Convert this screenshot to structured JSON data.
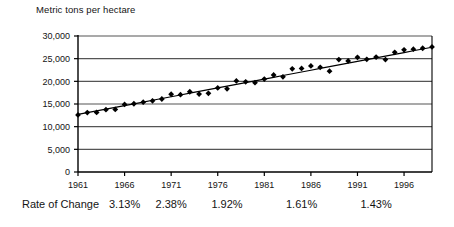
{
  "chart_data": {
    "type": "line",
    "title": "",
    "ylabel": "Metric tons per hectare",
    "xlabel": "",
    "ylim": [
      0,
      30000
    ],
    "xlim": [
      1961,
      1999
    ],
    "grid": true,
    "legend": "none",
    "ytick_labels": [
      "30,000",
      "25,000",
      "20,000",
      "15,000",
      "10,000",
      "5,000",
      "0"
    ],
    "ytick_values": [
      30000,
      25000,
      20000,
      15000,
      10000,
      5000,
      0
    ],
    "xtick_labels": [
      "1961",
      "1966",
      "1971",
      "1976",
      "1981",
      "1986",
      "1991",
      "1996"
    ],
    "xtick_values": [
      1961,
      1966,
      1971,
      1976,
      1981,
      1986,
      1991,
      1996
    ],
    "x": [
      1961,
      1962,
      1963,
      1964,
      1965,
      1966,
      1967,
      1968,
      1969,
      1970,
      1971,
      1972,
      1973,
      1974,
      1975,
      1976,
      1977,
      1978,
      1979,
      1980,
      1981,
      1982,
      1983,
      1984,
      1985,
      1986,
      1987,
      1988,
      1989,
      1990,
      1991,
      1992,
      1993,
      1994,
      1995,
      1996,
      1997,
      1998,
      1999
    ],
    "series": [
      {
        "name": "Metric tons per hectare",
        "marker": "diamond",
        "values": [
          12600,
          13100,
          13150,
          13750,
          13800,
          14900,
          15050,
          15400,
          15700,
          16100,
          17150,
          17050,
          17700,
          17200,
          17350,
          18550,
          18350,
          20100,
          19900,
          19700,
          20500,
          21400,
          21000,
          22750,
          22850,
          23400,
          23100,
          22250,
          24800,
          24500,
          25300,
          24850,
          25350,
          24800,
          26400,
          26950,
          27100,
          27300,
          27600
        ]
      },
      {
        "name": "trend-line",
        "marker": "none",
        "values": [
          12700,
          13090,
          13480,
          13870,
          14260,
          14650,
          15040,
          15430,
          15820,
          16210,
          16600,
          16990,
          17380,
          17770,
          18160,
          18550,
          18940,
          19330,
          19720,
          20110,
          20500,
          20890,
          21280,
          21670,
          22060,
          22450,
          22840,
          23230,
          23620,
          24010,
          24400,
          24790,
          25180,
          25570,
          25960,
          26350,
          26740,
          27130,
          27520
        ]
      }
    ],
    "annotations": {
      "rate_of_change_label": "Rate of Change",
      "rate_of_change_values": [
        "3.13%",
        "2.38%",
        "1.92%",
        "1.61%",
        "1.43%"
      ],
      "rate_of_change_positions": [
        1966,
        1971,
        1977,
        1985,
        1993
      ]
    }
  },
  "colors": {
    "marker": "#000000",
    "trend_line": "#000000",
    "grid": "#555555",
    "axis": "#000000",
    "text": "#141414",
    "background": "#ffffff"
  }
}
